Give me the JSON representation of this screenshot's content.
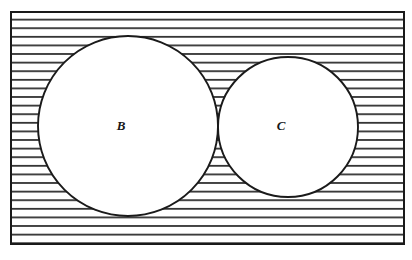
{
  "diagram": {
    "type": "venn-two-set",
    "title": "",
    "universe": {
      "name": "universal-set-rectangle",
      "x": 11,
      "y": 12,
      "width": 393,
      "height": 232,
      "stroke": "#1a1a1a",
      "fill": "#ffffff",
      "shading": "horizontal-hatch",
      "shading_region": "outside-both-circles",
      "hatch_spacing": 8.6,
      "hatch_stroke": "#262626"
    },
    "sets": [
      {
        "id": "B",
        "label": "B",
        "name": "circle-b",
        "cx": 128,
        "cy": 126,
        "r": 90,
        "label_x": 121,
        "label_y": 130,
        "stroke": "#1a1a1a",
        "fill": "#ffffff"
      },
      {
        "id": "C",
        "label": "C",
        "name": "circle-c",
        "cx": 288,
        "cy": 127,
        "r": 70,
        "label_x": 281,
        "label_y": 130,
        "stroke": "#1a1a1a",
        "fill": "#ffffff"
      }
    ],
    "intersection": {
      "name": "intersection-b-and-c",
      "label": "",
      "shading": "vertical-hatch",
      "hatch_spacing": 2.7,
      "hatch_stroke": "#303030",
      "approx_bounds": {
        "x1": 190,
        "y1": 75,
        "x2": 219,
        "y2": 185
      }
    },
    "colors": {
      "ink": "#1a1a1a",
      "paper": "#ffffff",
      "hatch": "#262626"
    }
  }
}
